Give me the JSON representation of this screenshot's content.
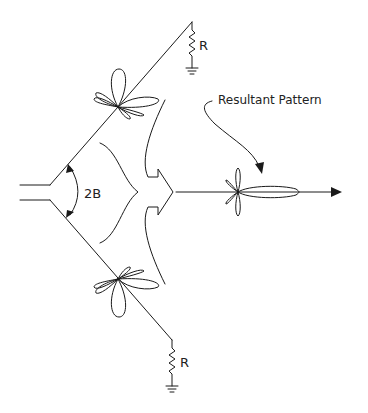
{
  "diagram": {
    "type": "V-antenna radiation pattern diagram",
    "labels": {
      "resistor_top": "R",
      "resistor_bottom": "R",
      "angle": "2B",
      "resultant": "Resultant Pattern"
    },
    "elements": [
      {
        "id": "feed-line",
        "kind": "two-wire transmission line"
      },
      {
        "id": "upper-leg",
        "kind": "antenna wire",
        "terminated_by": "resistor_top"
      },
      {
        "id": "lower-leg",
        "kind": "antenna wire",
        "terminated_by": "resistor_bottom"
      },
      {
        "id": "upper-leg-pattern",
        "kind": "multi-lobe radiation pattern"
      },
      {
        "id": "lower-leg-pattern",
        "kind": "multi-lobe radiation pattern"
      },
      {
        "id": "combining-arrow",
        "kind": "merging arrow"
      },
      {
        "id": "resultant-pattern",
        "kind": "directional radiation pattern with main forward lobe"
      },
      {
        "id": "direction-arrow",
        "kind": "arrow indicating main beam direction"
      }
    ],
    "colors": {
      "line": "#1a1a1a",
      "background": "#ffffff"
    }
  }
}
